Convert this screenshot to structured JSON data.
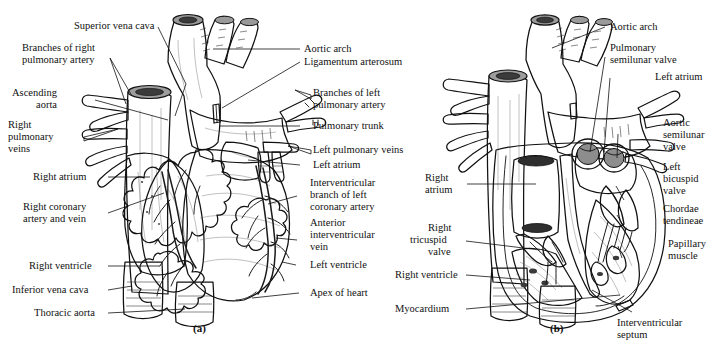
{
  "figure": {
    "type": "anatomical-diagram",
    "style": "grayscale line drawing with shading",
    "panels": [
      {
        "tag": "(a)",
        "view": "anterior external view of the heart",
        "labels": [
          "Superior vena cava",
          "Branches of right pulmonary artery",
          "Ascending aorta",
          "Right pulmonary veins",
          "Right atrium",
          "Right coronary artery and vein",
          "Right ventricle",
          "Inferior vena cava",
          "Thoracic aorta",
          "Aortic arch",
          "Ligamentum arterosum",
          "Branches of left pulmonary artery",
          "Pulmonary trunk",
          "Left pulmonary veins",
          "Left atrium",
          "Interventricular branch of left coronary artery",
          "Anterior interventricular vein",
          "Left ventricle",
          "Apex of heart"
        ]
      },
      {
        "tag": "(b)",
        "view": "frontal section showing internal chambers and valves",
        "labels": [
          "Aortic arch",
          "Pulmonary semilunar valve",
          "Left atrium",
          "Aortic semilunar valve",
          "Left bicuspid valve",
          "Chordae tendineae",
          "Papillary muscle",
          "Interventricular septum",
          "Right atrium",
          "Right tricuspid valve",
          "Right ventricle",
          "Myocardium"
        ]
      }
    ]
  },
  "panel_a": {
    "tag": "(a)",
    "labels": {
      "superior_vena_cava": "Superior vena cava",
      "branches_right_pulmonary_artery_l1": "Branches of right",
      "branches_right_pulmonary_artery_l2": "pulmonary artery",
      "ascending_aorta_l1": "Ascending",
      "ascending_aorta_l2": "aorta",
      "right_pulmonary_veins_l1": "Right",
      "right_pulmonary_veins_l2": "pulmonary",
      "right_pulmonary_veins_l3": "veins",
      "right_atrium": "Right atrium",
      "right_coronary_l1": "Right coronary",
      "right_coronary_l2": "artery and vein",
      "right_ventricle": "Right ventricle",
      "inferior_vena_cava": "Inferior vena cava",
      "thoracic_aorta": "Thoracic aorta",
      "aortic_arch": "Aortic arch",
      "ligamentum_arterosum": "Ligamentum arterosum",
      "branches_left_pulmonary_artery_l1": "Branches of left",
      "branches_left_pulmonary_artery_l2": "pulmonary artery",
      "pulmonary_trunk": "Pulmonary trunk",
      "left_pulmonary_veins": "Left pulmonary veins",
      "left_atrium": "Left atrium",
      "interventricular_branch_l1": "Interventricular",
      "interventricular_branch_l2": "branch of left",
      "interventricular_branch_l3": "coronary artery",
      "anterior_interventricular_vein_l1": "Anterior",
      "anterior_interventricular_vein_l2": "interventricular",
      "anterior_interventricular_vein_l3": "vein",
      "left_ventricle": "Left ventricle",
      "apex_of_heart": "Apex of heart"
    }
  },
  "panel_b": {
    "tag": "(b)",
    "labels": {
      "aortic_arch": "Aortic arch",
      "pulmonary_semilunar_valve_l1": "Pulmonary",
      "pulmonary_semilunar_valve_l2": "semilunar valve",
      "left_atrium": "Left atrium",
      "aortic_semilunar_valve_l1": "Aortic",
      "aortic_semilunar_valve_l2": "semilunar",
      "aortic_semilunar_valve_l3": "valve",
      "left_bicuspid_valve_l1": "Left",
      "left_bicuspid_valve_l2": "bicuspid",
      "left_bicuspid_valve_l3": "valve",
      "chordae_tendineae_l1": "Chordae",
      "chordae_tendineae_l2": "tendineae",
      "papillary_muscle_l1": "Papillary",
      "papillary_muscle_l2": "muscle",
      "interventricular_septum_l1": "Interventricular",
      "interventricular_septum_l2": "septum",
      "right_atrium_l1": "Right",
      "right_atrium_l2": "atrium",
      "right_tricuspid_valve_l1": "Right",
      "right_tricuspid_valve_l2": "tricuspid",
      "right_tricuspid_valve_l3": "valve",
      "right_ventricle": "Right ventricle",
      "myocardium": "Myocardium"
    }
  },
  "colors": {
    "background": "#ffffff",
    "outline": "#111111",
    "vessel_mid_gray": "#8e8e8e",
    "vessel_dark_gray": "#6d6d6d",
    "muscle_gray": "#7d7d7d",
    "atrium_dark": "#5f5f5f",
    "fat_light": "#d9d9d2",
    "highlight_light": "#b9b9b4",
    "chamber_dark": "#4f4f4f",
    "text": "#111111"
  }
}
